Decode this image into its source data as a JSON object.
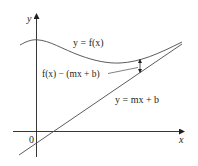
{
  "figure": {
    "axes": {
      "x_label": "x",
      "y_label": "y",
      "origin_label": "0"
    },
    "curve_label": "y = f(x)",
    "asymptote_label": "y = mx + b",
    "difference_label": "f(x) − (mx + b)",
    "colors": {
      "ink": "#231f20",
      "curve": "#4a4a4a",
      "background": "#ffffff"
    }
  }
}
